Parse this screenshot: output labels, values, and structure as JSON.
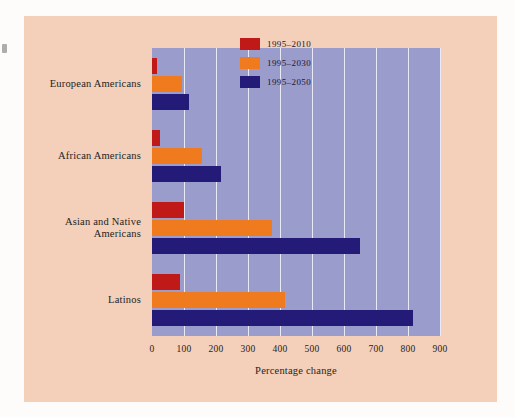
{
  "figure": {
    "background_color": "#f4cfba",
    "page_color": "#fdfcfb",
    "plot_background_color": "#9a9ccc",
    "gridline_color": "#e9eaf6"
  },
  "chart_data": {
    "type": "bar",
    "orientation": "horizontal",
    "title": "",
    "xlabel": "Percentage change",
    "ylabel": "",
    "xlim": [
      0,
      900
    ],
    "xticks": [
      0,
      100,
      200,
      300,
      400,
      500,
      600,
      700,
      800,
      900
    ],
    "xtick_labels": [
      "0",
      "100",
      "200",
      "300",
      "400",
      "500",
      "600",
      "700",
      "800",
      "900"
    ],
    "grid": true,
    "legend_position": "top-right",
    "categories": [
      "European Americans",
      "African Americans",
      "Asian and Native Americans",
      "Latinos"
    ],
    "category_lines": [
      [
        "European Americans"
      ],
      [
        "African Americans"
      ],
      [
        "Asian and Native",
        "Americans"
      ],
      [
        "Latinos"
      ]
    ],
    "series": [
      {
        "name": "1995–2010",
        "color": "#c01a18",
        "values": [
          15,
          25,
          100,
          88
        ]
      },
      {
        "name": "1995–2030",
        "color": "#f07a1e",
        "values": [
          95,
          155,
          375,
          415
        ]
      },
      {
        "name": "1995–2050",
        "color": "#241a78",
        "values": [
          115,
          215,
          650,
          815
        ]
      }
    ]
  }
}
